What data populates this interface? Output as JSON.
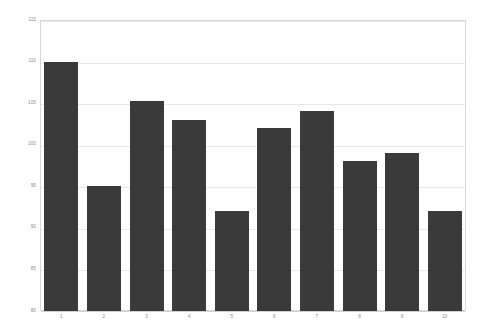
{
  "chart_data": {
    "type": "bar",
    "title": "",
    "subtitle": "",
    "xlabel": "",
    "ylabel": "",
    "categories": [
      "1",
      "2",
      "3",
      "4",
      "5",
      "6",
      "7",
      "8",
      "9",
      "10"
    ],
    "values": [
      110,
      95,
      105.3,
      103,
      92,
      102,
      104,
      98,
      99,
      92
    ],
    "series": [
      {
        "name": "",
        "values": [
          110,
          95,
          105.3,
          103,
          92,
          102,
          104,
          98,
          99,
          92
        ]
      }
    ],
    "ylim": [
      80,
      115
    ],
    "yticks": [
      80,
      85,
      90,
      95,
      100,
      105,
      110,
      115
    ],
    "ytick_labels": [
      "80",
      "85",
      "90",
      "95",
      "100",
      "105",
      "110",
      "115"
    ],
    "xtick_labels": [
      "1",
      "2",
      "3",
      "4",
      "5",
      "6",
      "7",
      "8",
      "9",
      "10"
    ],
    "grid": true,
    "grid_axis": "y",
    "legend": false,
    "legend_position": "none",
    "annotations": [],
    "colors": {
      "bar_fill": "#3a3a3a",
      "gridline": "#e8e8e8",
      "plot_border": "#d8d8d8",
      "tick_label": "#8a8a8a",
      "background": "#ffffff"
    }
  }
}
